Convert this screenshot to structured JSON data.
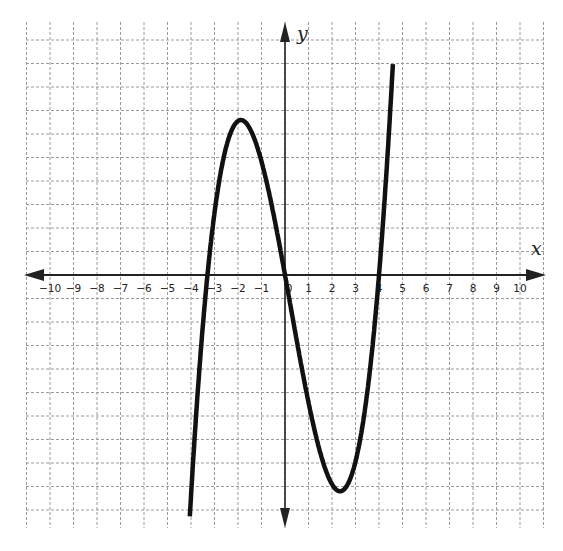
{
  "chart_data": {
    "type": "line",
    "title": "",
    "xlabel": "x",
    "ylabel": "y",
    "xlim": [
      -11,
      11
    ],
    "ylim": [
      -11,
      10.5
    ],
    "grid": true,
    "x_tick_labels": [
      "-10",
      "-9",
      "-8",
      "-7",
      "-6",
      "-5",
      "-4",
      "-3",
      "-2",
      "-1",
      "0",
      "1",
      "2",
      "3",
      "4",
      "5",
      "6",
      "7",
      "8",
      "9",
      "10"
    ],
    "x_ticks": [
      -10,
      -9,
      -8,
      -7,
      -6,
      -5,
      -4,
      -3,
      -2,
      -1,
      0,
      1,
      2,
      3,
      4,
      5,
      6,
      7,
      8,
      9,
      10
    ],
    "series": [
      {
        "name": "cubic",
        "description": "Cubic polynomial f(x)=a*x*(x+3.3)*(x-4)",
        "roots": [
          -3.3,
          0,
          4
        ],
        "local_max": {
          "x": -1.8,
          "y": 6
        },
        "local_min": {
          "x": 2.3,
          "y": -10.2
        },
        "coefficient_a": 0.42,
        "x_range": [
          -4.05,
          4.6
        ]
      }
    ]
  },
  "labels": {
    "x_axis": "x",
    "y_axis": "y"
  },
  "layout": {
    "origin_px": [
      285,
      275
    ],
    "unit_px": 23.5,
    "grid_left": 26,
    "grid_right": 546,
    "grid_top": 22,
    "grid_bottom": 528,
    "axis_color": "#222222",
    "grid_color": "#9a9a9a",
    "curve_color": "#111111"
  }
}
